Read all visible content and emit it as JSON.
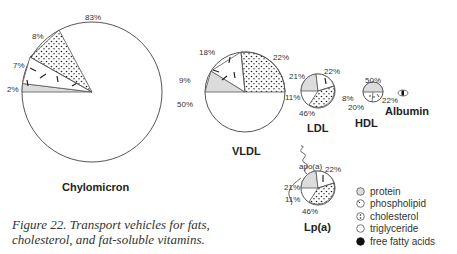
{
  "figure": {
    "caption": "Figure 22. Transport vehicles for fats, cholesterol, and fat-soluble vitamins.",
    "caption_line1": "Figure 22. Transport vehicles for fats,",
    "caption_line2": "cholesterol, and fat-soluble vitamins."
  },
  "particles": [
    {
      "name": "Chylomicron",
      "labels": {
        "triglyceride": "83%",
        "cholesterol": "8%",
        "phospholipid": "7%",
        "protein": "2%"
      }
    },
    {
      "name": "VLDL",
      "labels": {
        "phospholipid": "18%",
        "cholesterol": "22%",
        "protein": "9%",
        "triglyceride": "50%"
      }
    },
    {
      "name": "LDL",
      "labels": {
        "protein": "21%",
        "phospholipid": "22%",
        "triglyceride": "11%",
        "cholesterol": "46%"
      }
    },
    {
      "name": "HDL",
      "labels": {
        "protein": "50%",
        "triglyceride": "8%",
        "cholesterol": "20%",
        "phospholipid": "22%"
      }
    },
    {
      "name": "Albumin"
    },
    {
      "name": "Lp(a)",
      "apo_label": "apo(a)",
      "labels": {
        "protein": "21%",
        "phospholipid": "22%",
        "triglyceride": "11%",
        "cholesterol": "46%"
      }
    }
  ],
  "legend": [
    {
      "label": "protein",
      "icon": "gray-circle"
    },
    {
      "label": "phospholipid",
      "icon": "dash-circle"
    },
    {
      "label": "cholesterol",
      "icon": "dot-circle"
    },
    {
      "label": "triglyceride",
      "icon": "empty-circle"
    },
    {
      "label": "free fatty acids",
      "icon": "black-circle"
    }
  ],
  "colors": {
    "protein": "#dcdcdc",
    "outline": "#555555",
    "ffa": "#111111"
  }
}
